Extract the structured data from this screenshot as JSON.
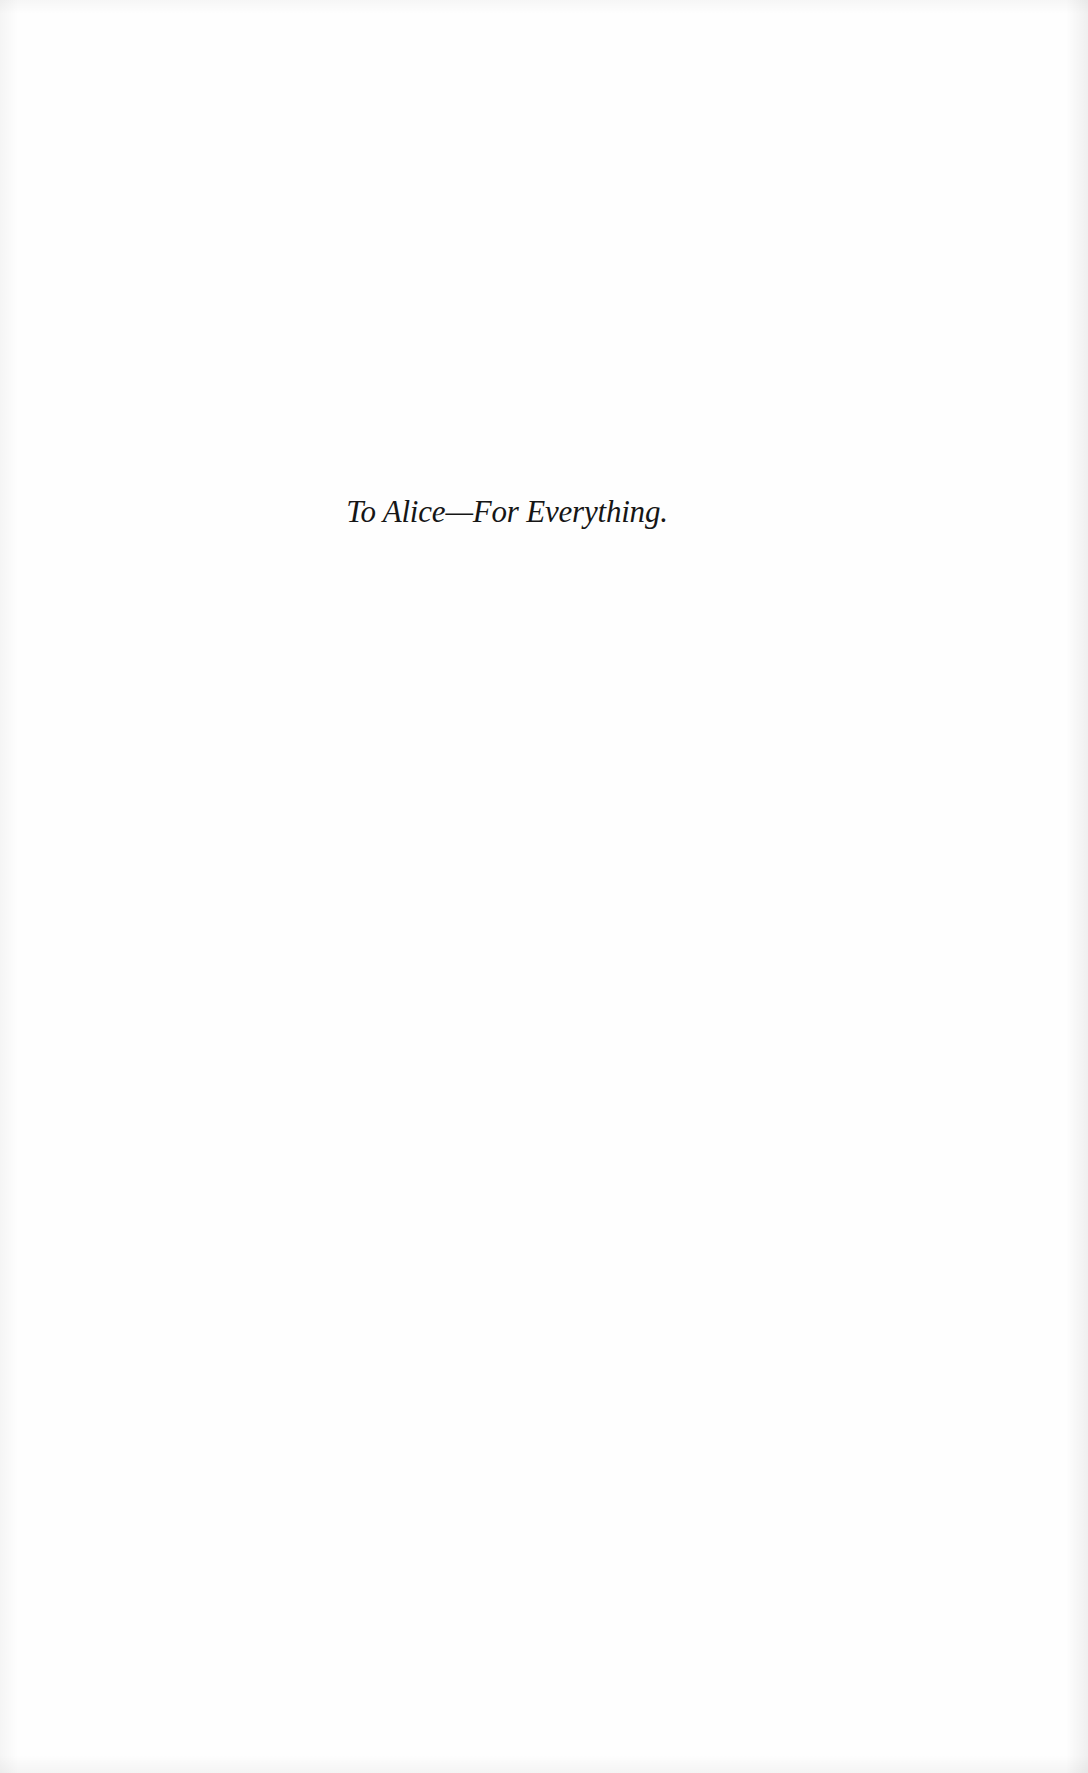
{
  "page": {
    "dedication": "To Alice—For Everything."
  }
}
